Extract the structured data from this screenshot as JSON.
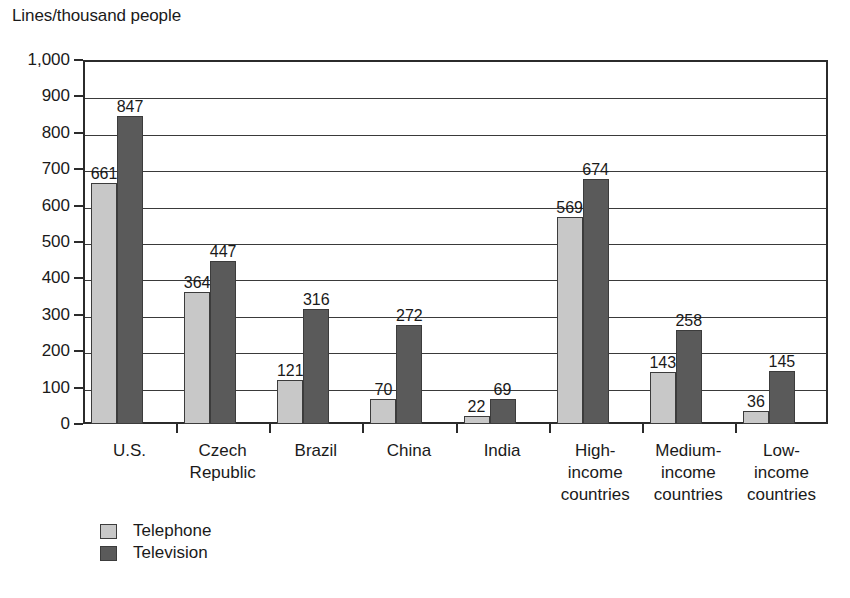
{
  "chart_data": {
    "type": "bar",
    "title": "Lines/thousand people",
    "xlabel": "",
    "ylabel": "Lines/thousand people",
    "ylim": [
      0,
      1000
    ],
    "ytick_step": 100,
    "grid": true,
    "legend_position": "bottom-left",
    "categories": [
      "U.S.",
      "Czech\nRepublic",
      "Brazil",
      "China",
      "India",
      "High-\nincome\ncountries",
      "Medium-\nincome\ncountries",
      "Low-\nincome\ncountries"
    ],
    "series": [
      {
        "name": "Telephone",
        "color": "#c8c8c8",
        "values": [
          661,
          364,
          121,
          70,
          22,
          569,
          143,
          36
        ]
      },
      {
        "name": "Television",
        "color": "#5a5a5a",
        "values": [
          847,
          447,
          316,
          272,
          69,
          674,
          258,
          145
        ]
      }
    ],
    "ytick_labels": [
      "0",
      "100",
      "200",
      "300",
      "400",
      "500",
      "600",
      "700",
      "800",
      "900",
      "1,000"
    ]
  },
  "legend": {
    "items": [
      {
        "label": "Telephone",
        "color": "#c8c8c8"
      },
      {
        "label": "Television",
        "color": "#5a5a5a"
      }
    ]
  }
}
